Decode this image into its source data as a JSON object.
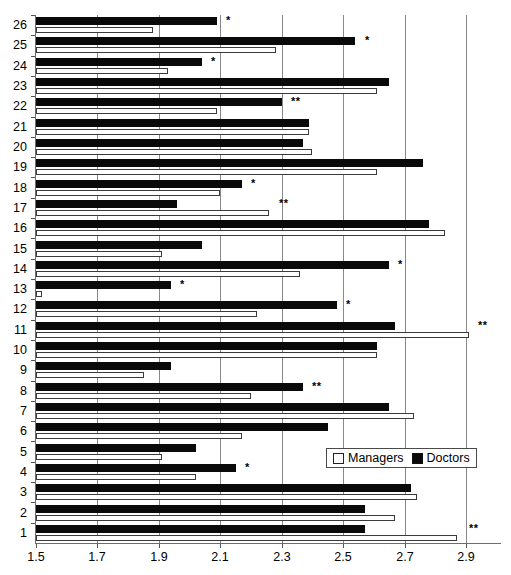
{
  "chart_data": {
    "type": "bar",
    "orientation": "horizontal",
    "title": "",
    "xlabel": "",
    "ylabel": "",
    "xlim": [
      1.5,
      2.9
    ],
    "xticks": [
      1.5,
      1.7,
      1.9,
      2.1,
      2.3,
      2.5,
      2.7,
      2.9
    ],
    "xtick_labels": [
      "1.5",
      "1.7",
      "1.9",
      "2.1",
      "2.3",
      "2.5",
      "2.7",
      "2.9"
    ],
    "grid": true,
    "grid_axis": "x",
    "legend_position": "lower right",
    "categories": [
      "1",
      "2",
      "3",
      "4",
      "5",
      "6",
      "7",
      "8",
      "9",
      "10",
      "11",
      "12",
      "13",
      "14",
      "15",
      "16",
      "17",
      "18",
      "19",
      "20",
      "21",
      "22",
      "23",
      "24",
      "25",
      "26"
    ],
    "series": [
      {
        "name": "Managers",
        "fill": "#ffffff",
        "edge": "#3a3a3a",
        "values": [
          2.87,
          2.67,
          2.74,
          2.02,
          1.91,
          2.17,
          2.73,
          2.2,
          1.85,
          2.61,
          2.91,
          2.22,
          1.52,
          2.36,
          1.91,
          2.83,
          2.26,
          2.1,
          2.61,
          2.4,
          2.39,
          2.09,
          2.61,
          1.93,
          2.28,
          1.88
        ]
      },
      {
        "name": "Doctors",
        "fill": "#0a0a0a",
        "edge": "#0a0a0a",
        "values": [
          2.57,
          2.57,
          2.72,
          2.15,
          2.02,
          2.45,
          2.65,
          2.37,
          1.94,
          2.61,
          2.67,
          2.48,
          1.94,
          2.65,
          2.04,
          2.78,
          1.96,
          2.17,
          2.76,
          2.37,
          2.39,
          2.3,
          2.65,
          2.04,
          2.54,
          2.09
        ]
      }
    ],
    "annotations": [
      {
        "category": "1",
        "text": "**",
        "x": 2.91
      },
      {
        "category": "4",
        "text": "*",
        "x": 2.18
      },
      {
        "category": "8",
        "text": "**",
        "x": 2.4
      },
      {
        "category": "11",
        "text": "**",
        "x": 2.94
      },
      {
        "category": "12",
        "text": "*",
        "x": 2.51
      },
      {
        "category": "13",
        "text": "*",
        "x": 1.97
      },
      {
        "category": "14",
        "text": "*",
        "x": 2.68
      },
      {
        "category": "17",
        "text": "**",
        "x": 2.29
      },
      {
        "category": "18",
        "text": "*",
        "x": 2.2
      },
      {
        "category": "22",
        "text": "**",
        "x": 2.33
      },
      {
        "category": "24",
        "text": "*",
        "x": 2.07
      },
      {
        "category": "25",
        "text": "*",
        "x": 2.57
      },
      {
        "category": "26",
        "text": "*",
        "x": 2.12
      }
    ]
  },
  "legend": {
    "managers_label": "Managers",
    "doctors_label": "Doctors"
  },
  "colors": {
    "doctors": "#0a0a0a",
    "managers": "#ffffff",
    "grid": "#888888",
    "axis": "#6d6d6d"
  }
}
